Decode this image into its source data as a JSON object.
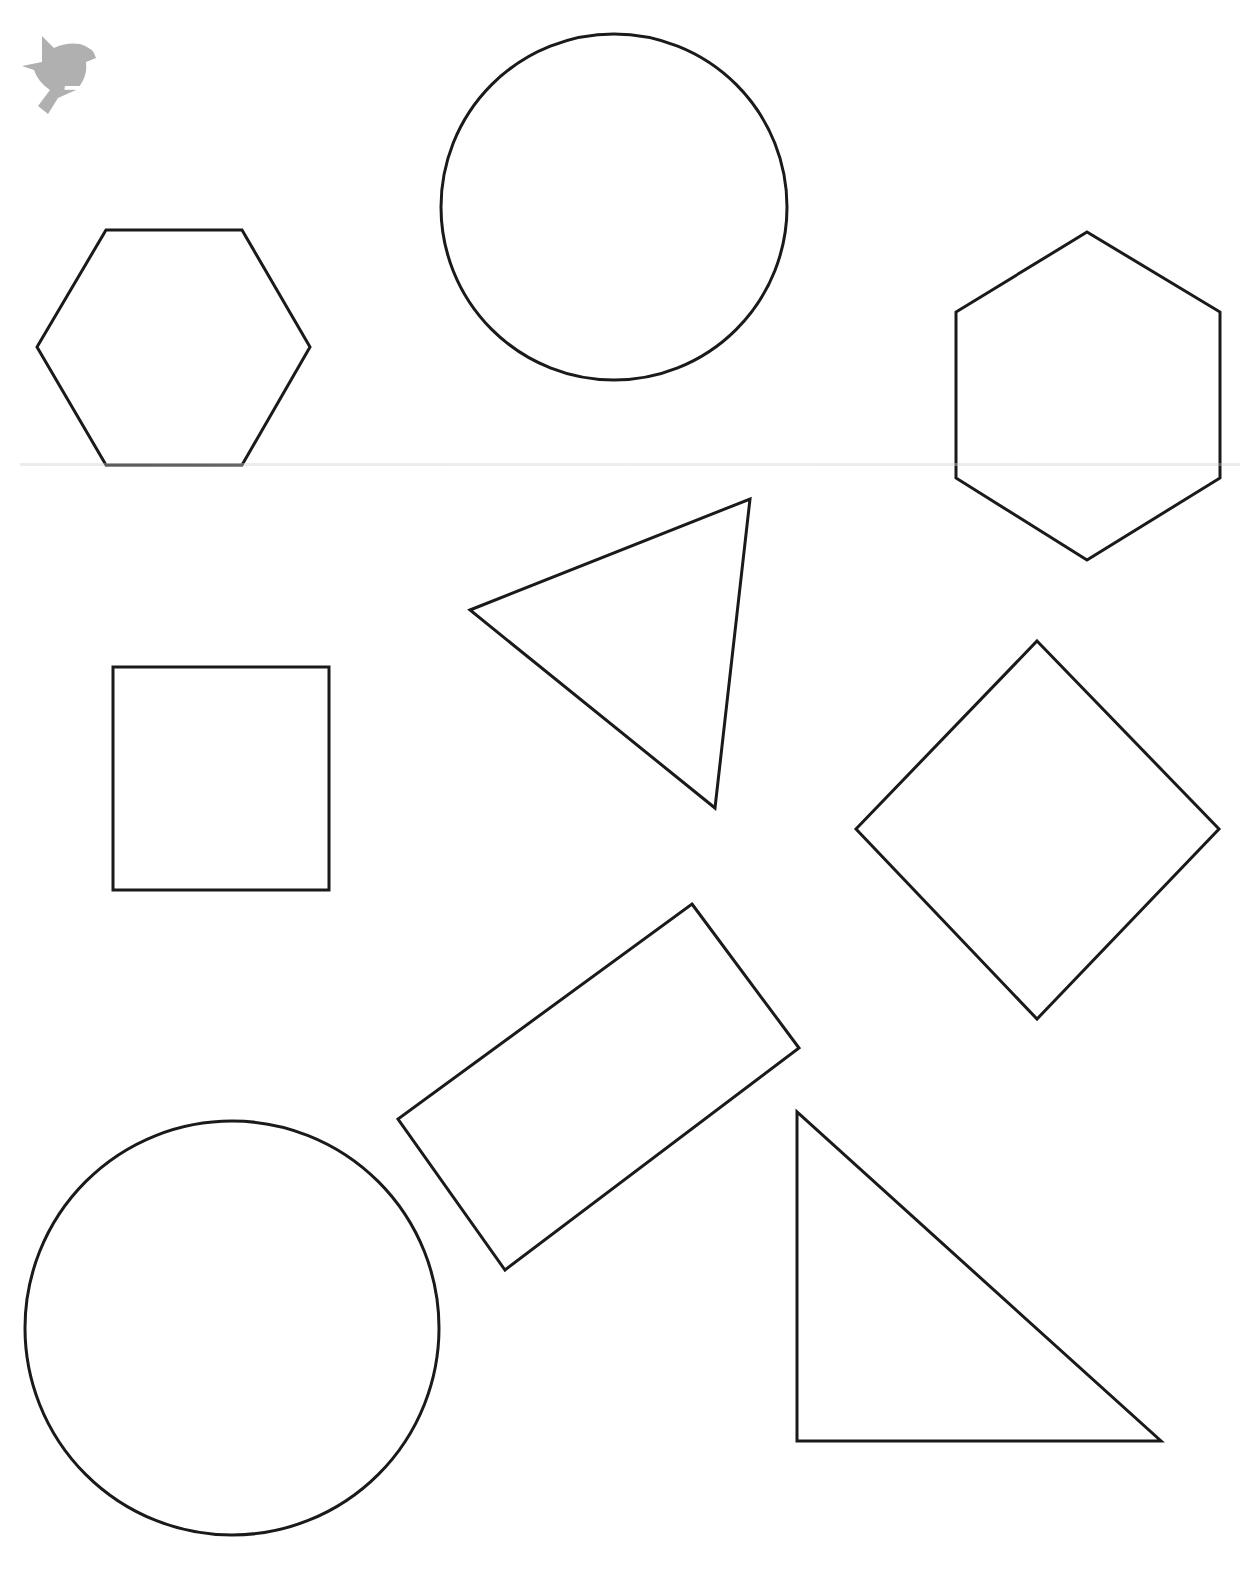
{
  "page": {
    "stroke_color": "#1a1a1a",
    "background": "#ffffff"
  },
  "logo": {
    "icon": "dove-icon",
    "number": "7",
    "color": "#b0b0b0"
  },
  "shapes": [
    {
      "type": "circle",
      "label": "circle-top",
      "cx": 614,
      "cy": 207,
      "r": 173
    },
    {
      "type": "hexagon",
      "label": "hexagon-left",
      "points": "106,230 242,230 310,347 242,465 106,465 37,347"
    },
    {
      "type": "hexagon",
      "label": "hexagon-right",
      "points": "1087,232 1220,312 1220,478 1087,560 956,478 956,312"
    },
    {
      "type": "triangle",
      "label": "triangle-middle",
      "points": "470,610 750,499 715,808"
    },
    {
      "type": "square",
      "label": "square-left",
      "points": "113,667 329,667 329,890 113,890"
    },
    {
      "type": "diamond",
      "label": "diamond-right",
      "points": "1037,641 1219,829 1037,1019 856,829"
    },
    {
      "type": "rectangle",
      "label": "rectangle-tilted",
      "points": "692,904 799,1048 505,1270 398,1119"
    },
    {
      "type": "circle",
      "label": "circle-bottom",
      "cx": 232,
      "cy": 1328,
      "r": 207
    },
    {
      "type": "right-triangle",
      "label": "right-triangle",
      "points": "797,1112 797,1441 1161,1441"
    }
  ]
}
